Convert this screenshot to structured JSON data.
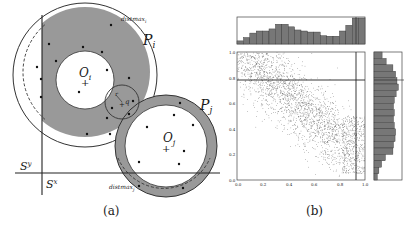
{
  "panel_a": {
    "caption": "(a)",
    "labels": {
      "Pi": "P",
      "Pi_sub": "i",
      "Pj": "P",
      "Pj_sub": "j",
      "Oi": "O",
      "Oi_sub": "i",
      "Oj": "O",
      "Oj_sub": "j",
      "Sy": "S",
      "Sy_sup": "y",
      "Sx": "S",
      "Sx_sup": "x",
      "distmax_i": "distmax",
      "distmax_i_sub": "i",
      "distmax_j": "distmax",
      "distmax_j_sub": "j",
      "r": "r",
      "q": "q"
    },
    "colors": {
      "ring_fill": "#999999",
      "line": "#333333",
      "bg": "#ffffff"
    }
  },
  "panel_b": {
    "caption": "(b)",
    "x_ticks": [
      "0.0",
      "0.2",
      "0.4",
      "0.6",
      "0.8",
      "1.0"
    ],
    "y_ticks": [
      "0.0",
      "0.2",
      "0.4",
      "0.6",
      "0.8",
      "1.0"
    ],
    "colors": {
      "bar_fill": "#777777",
      "point": "#666666",
      "frame": "#444444"
    }
  },
  "chart_data": {
    "type": "scatter",
    "title": "",
    "xlabel": "",
    "ylabel": "",
    "xlim": [
      0.0,
      1.0
    ],
    "ylim": [
      0.0,
      1.0
    ],
    "x_ticks": [
      0.0,
      0.2,
      0.4,
      0.6,
      0.8,
      1.0
    ],
    "y_ticks": [
      0.0,
      0.2,
      0.4,
      0.6,
      0.8,
      1.0
    ],
    "reference_lines": {
      "horizontal_y": 0.78,
      "vertical_x": 0.92
    },
    "top_histogram": {
      "bins": 20,
      "relative_heights": [
        0.12,
        0.25,
        0.42,
        0.5,
        0.5,
        0.58,
        0.76,
        0.76,
        0.66,
        0.54,
        0.5,
        0.46,
        0.46,
        0.32,
        0.3,
        0.3,
        0.5,
        0.72,
        1.0,
        1.0
      ]
    },
    "right_histogram": {
      "bins": 20,
      "orientation": "horizontal",
      "order": "top_to_bottom",
      "relative_widths": [
        0.3,
        0.45,
        0.7,
        0.8,
        0.85,
        0.9,
        0.82,
        0.75,
        0.72,
        0.75,
        0.72,
        0.75,
        0.8,
        0.78,
        0.72,
        0.7,
        0.42,
        0.28,
        0.18,
        0.12
      ]
    }
  }
}
